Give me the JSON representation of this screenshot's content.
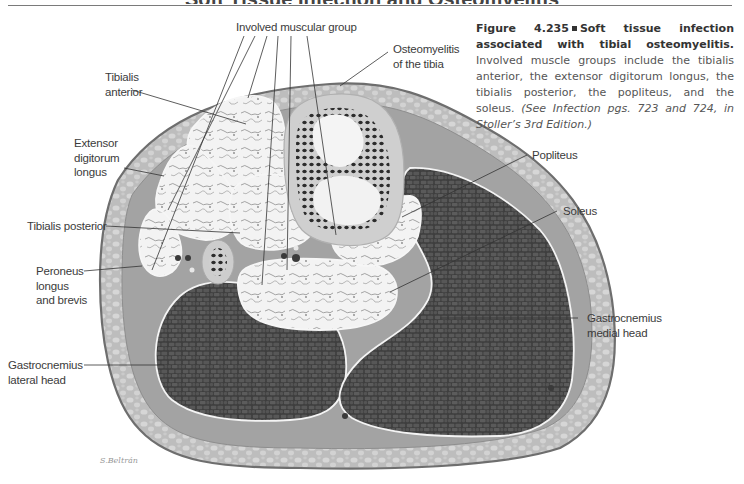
{
  "page": {
    "header_cropped_text": "Soft Tissue Infection and Osteomyelitis"
  },
  "figure": {
    "top_label": "Involved muscular group",
    "labels": {
      "tibialis_anterior": [
        "Tibialis",
        "anterior"
      ],
      "extensor_digitorum_longus": [
        "Extensor",
        "digitorum",
        "longus"
      ],
      "tibialis_posterior": "Tibialis posterior",
      "peroneus": [
        "Peroneus",
        "longus",
        "and brevis"
      ],
      "gastrocnemius_lateral": [
        "Gastrocnemius",
        "lateral head"
      ],
      "osteomyelitis": [
        "Osteomyelitis",
        "of the tibia"
      ],
      "popliteus": "Popliteus",
      "soleus": "Soleus",
      "gastrocnemius_medial": [
        "Gastrocnemius",
        "medial head"
      ]
    },
    "signature": "S.Beltrán",
    "colors": {
      "skin_outline": "#6e6e6e",
      "subcutaneous_fat": "#b9b9b9",
      "fascia": "#9c9c9c",
      "infected_muscle": "#f0f0f0",
      "normal_muscle": "#4a4a4a",
      "bone_cortex": "#cfcfcf",
      "marrow_dark": "#2e2e2e"
    }
  },
  "caption": {
    "figure_number": "Figure 4.235",
    "title": "Soft tissue infection associated with tibial osteomyelitis.",
    "body": "Involved muscle groups include the tibialis anterior, the extensor digitorum longus, the tibialis posterior, the popliteus, and the soleus.",
    "reference": "(See Infection pgs. 723 and 724, in Stoller’s 3rd Edition.)"
  }
}
